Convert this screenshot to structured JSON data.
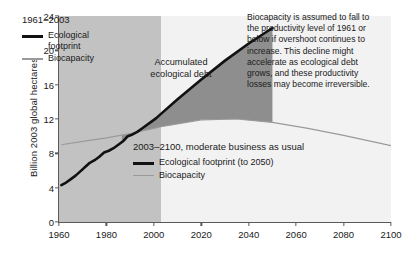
{
  "chart_data": {
    "type": "area",
    "title": "",
    "xlabel": "",
    "ylabel": "Billion 2003 global hectares",
    "xlim": [
      1960,
      2100
    ],
    "ylim": [
      0,
      24
    ],
    "xticks": [
      1960,
      1980,
      2000,
      2020,
      2040,
      2060,
      2080,
      2100
    ],
    "yticks": [
      0,
      4,
      8,
      12,
      16,
      20,
      24
    ],
    "grid": false,
    "history_end_year": 2003,
    "series": [
      {
        "name": "Ecological footprint",
        "period": "1961-2003",
        "style": "thick-black",
        "x": [
          1961,
          1963,
          1965,
          1967,
          1969,
          1971,
          1973,
          1975,
          1977,
          1979,
          1981,
          1983,
          1985,
          1987,
          1989,
          1991,
          1993,
          1995,
          1997,
          1999,
          2001,
          2003
        ],
        "values": [
          4.3,
          4.6,
          5.0,
          5.4,
          5.9,
          6.4,
          6.9,
          7.2,
          7.6,
          8.1,
          8.3,
          8.6,
          9.0,
          9.4,
          10.0,
          10.2,
          10.5,
          10.9,
          11.3,
          11.7,
          12.1,
          12.6
        ]
      },
      {
        "name": "Ecological footprint (to 2050)",
        "period": "2003-2050",
        "style": "thick-black",
        "x": [
          2003,
          2010,
          2020,
          2030,
          2040,
          2050
        ],
        "values": [
          12.6,
          14.3,
          16.6,
          18.8,
          20.8,
          22.6
        ]
      },
      {
        "name": "Biocapacity",
        "period": "1961-2003",
        "style": "thin-gray",
        "x": [
          1961,
          1970,
          1980,
          1990,
          2000,
          2003
        ],
        "values": [
          9.0,
          9.4,
          9.8,
          10.3,
          10.9,
          11.1
        ]
      },
      {
        "name": "Biocapacity",
        "period": "2003-2100",
        "style": "thin-gray",
        "x": [
          2003,
          2020,
          2035,
          2050,
          2065,
          2080,
          2100
        ],
        "values": [
          11.1,
          11.9,
          12.0,
          11.6,
          10.9,
          10.1,
          8.9
        ]
      }
    ],
    "shaded_regions": [
      {
        "name": "history-band",
        "from": 1960,
        "to": 2003,
        "color": "#c2c2c2"
      },
      {
        "name": "projection-band",
        "from": 2003,
        "to": 2100,
        "color": "#f2f2f2"
      }
    ],
    "annotations": [
      {
        "name": "accumulated-ecological-debt",
        "text": "Accumulated\necological debt"
      },
      {
        "name": "biocapacity-note",
        "text": "Biocapacity is assumed to fall to the productivity level of 1961 or below if overshoot continues to increase. This decline might accelerate as ecological debt grows, and these productivity losses may become irreversible."
      }
    ]
  },
  "axes": {
    "ylabel": "Billion 2003 global hectares",
    "yticks": [
      "0",
      "4",
      "8",
      "12",
      "16",
      "20",
      "24"
    ],
    "xticks": [
      "1960",
      "1980",
      "2000",
      "2020",
      "2040",
      "2060",
      "2080",
      "2100"
    ]
  },
  "legend_history": {
    "title": "1961–2003",
    "items": [
      {
        "label": "Ecological\nfootprint",
        "style": "thick-black"
      },
      {
        "label": "Biocapacity",
        "style": "thin-gray"
      }
    ]
  },
  "legend_projection": {
    "title": "2003–2100, moderate business as usual",
    "items": [
      {
        "label": "Ecological footprint (to 2050)",
        "style": "thick-black"
      },
      {
        "label": "Biocapacity",
        "style": "thin-gray"
      }
    ]
  },
  "debt_label": "Accumulated\necological debt",
  "note": "Biocapacity is assumed to fall to the productivity level of 1961 or below if overshoot continues to increase. This decline might accelerate as ecological debt grows, and these productivity losses may become irreversible.",
  "colors": {
    "footprint": "#111111",
    "biocapacity": "#9a9a9a",
    "debt_fill": "#8e8e8e",
    "history_band": "#c2c2c2",
    "projection_band": "#f2f2f2",
    "axis": "#5a5a5a"
  }
}
